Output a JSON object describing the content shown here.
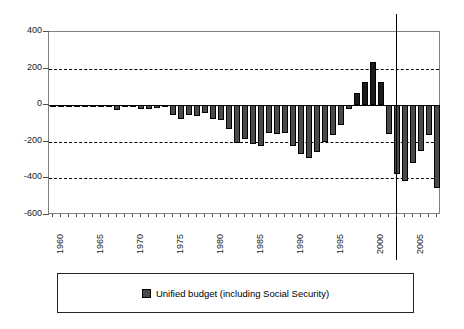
{
  "chart_data": {
    "type": "bar",
    "title": "",
    "subtitle": "",
    "xlabel": "",
    "ylabel": "",
    "ylim": [
      -600,
      400
    ],
    "yticks": [
      400,
      200,
      0,
      -200,
      -400,
      -600
    ],
    "ytick_labels": [
      "400",
      "200",
      "0",
      "-200",
      "-400",
      "-600"
    ],
    "grid": "horizontal dashed at 200, -200, -400; solid baseline at 0",
    "legend_position": "below-plot",
    "xtick_labels": [
      "1960",
      "1965",
      "1970",
      "1975",
      "1980",
      "1985",
      "1990",
      "1995",
      "2000",
      "2005"
    ],
    "xtick_years": [
      1960,
      1965,
      1970,
      1975,
      1980,
      1985,
      1990,
      1995,
      2000,
      2005
    ],
    "annotations": [
      {
        "name": "projection-divider",
        "type": "vertical-line",
        "year": 2003.0,
        "label": ""
      }
    ],
    "series": [
      {
        "name": "Unified budget (including Social Security)",
        "color": "#4a4a4a",
        "categories": [
          1960,
          1961,
          1962,
          1963,
          1964,
          1965,
          1966,
          1967,
          1968,
          1969,
          1970,
          1971,
          1972,
          1973,
          1974,
          1975,
          1976,
          1977,
          1978,
          1979,
          1980,
          1981,
          1982,
          1983,
          1984,
          1985,
          1986,
          1987,
          1988,
          1989,
          1990,
          1991,
          1992,
          1993,
          1994,
          1995,
          1996,
          1997,
          1998,
          1999,
          2000,
          2001,
          2002,
          2003,
          2004,
          2005,
          2006,
          2007,
          2008
        ],
        "values": [
          0,
          -3,
          -7,
          -5,
          -6,
          -1,
          -4,
          -9,
          -25,
          3,
          -3,
          -23,
          -23,
          -15,
          -6,
          -53,
          -74,
          -54,
          -59,
          -41,
          -74,
          -79,
          -128,
          -208,
          -185,
          -212,
          -221,
          -150,
          -155,
          -152,
          -221,
          -269,
          -290,
          -255,
          -203,
          -164,
          -107,
          -22,
          69,
          126,
          236,
          127,
          -158,
          -375,
          -412,
          -318,
          -248,
          -162,
          -455
        ]
      }
    ]
  },
  "legend": {
    "entry_label": "Unified budget (including Social Security)",
    "swatch_color": "#4a4a4a"
  },
  "axes": {
    "y": {
      "labels": [
        "400",
        "200",
        "0",
        "-200",
        "-400",
        "-600"
      ]
    },
    "x": {
      "labels": [
        "1960",
        "1965",
        "1970",
        "1975",
        "1980",
        "1985",
        "1990",
        "1995",
        "2000",
        "2005"
      ]
    }
  }
}
